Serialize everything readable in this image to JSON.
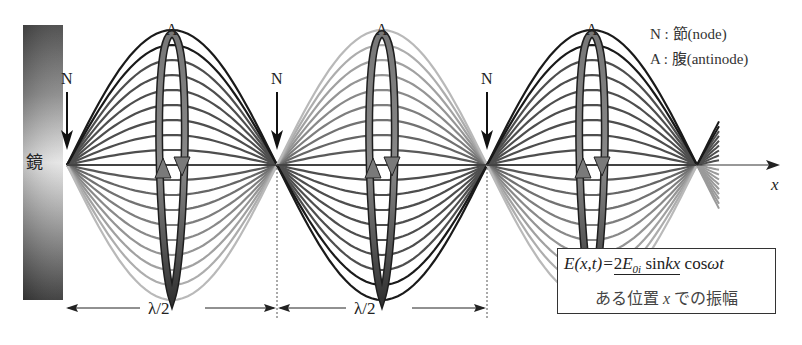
{
  "diagram": {
    "type": "standing-wave",
    "mirror_label": "鏡",
    "axis_label": "x",
    "node_label": "N",
    "antinode_label": "A",
    "half_wavelength_label": "λ/2",
    "legend": {
      "node": "N : 節(node)",
      "antinode": "A : 腹(antinode)"
    },
    "formula": {
      "lhs": "E(x,t)=",
      "amplitude_coef": "2",
      "amplitude_E": "E",
      "amplitude_sub": "0i",
      "sin_part": " sin",
      "sin_arg": "kx",
      "cos_part": " cos",
      "cos_arg": "ωt",
      "caption_pre": "ある位置 ",
      "caption_var": "x",
      "caption_post": " での振幅"
    },
    "nodes_x": [
      67,
      277,
      487,
      697
    ],
    "antinodes_x": [
      172,
      382,
      592
    ],
    "colors": {
      "dark_curve": "#1a1a1a",
      "mid_curve": "#4a4a4a",
      "light_curve": "#b8b8b8",
      "loop_fill": "#6a6a6a",
      "loop_outline": "#1e1e1e"
    }
  }
}
